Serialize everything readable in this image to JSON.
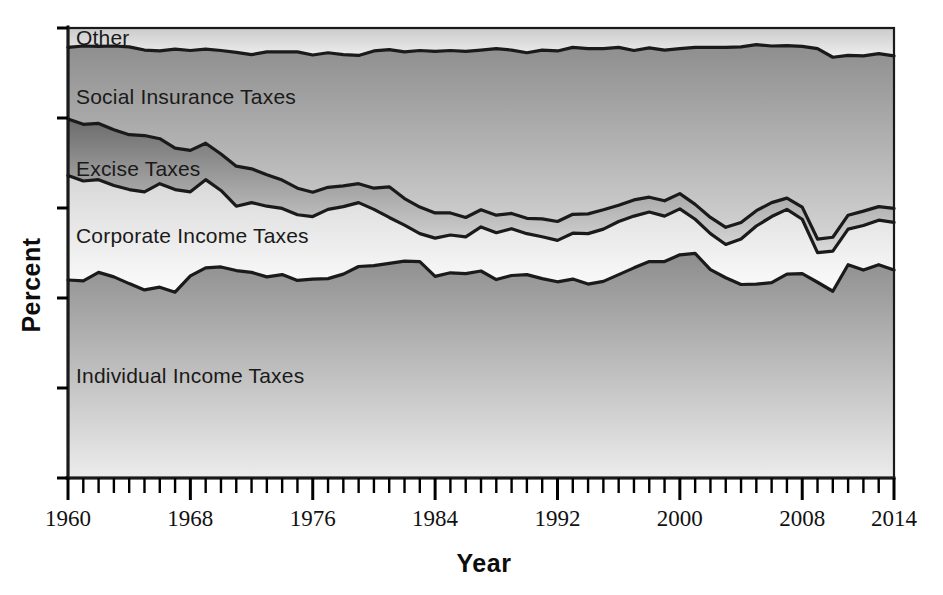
{
  "chart_data": {
    "type": "area",
    "stacked": "percent",
    "title": "",
    "xlabel": "Year",
    "ylabel": "Percent",
    "grid": false,
    "legend_position": "inline-labels",
    "xlim": [
      1960,
      2014
    ],
    "ylim": [
      0,
      100
    ],
    "x_tick_labels": [
      "1960",
      "1968",
      "1976",
      "1984",
      "1992",
      "2000",
      "2008",
      "2014"
    ],
    "x_tick_values": [
      1960,
      1968,
      1976,
      1984,
      1992,
      2000,
      2008,
      2014
    ],
    "x_minor_tick_step": 1,
    "y_tick_labels": [],
    "y_tick_count": 6,
    "x": [
      1960,
      1961,
      1962,
      1963,
      1964,
      1965,
      1966,
      1967,
      1968,
      1969,
      1970,
      1971,
      1972,
      1973,
      1974,
      1975,
      1976,
      1977,
      1978,
      1979,
      1980,
      1981,
      1982,
      1983,
      1984,
      1985,
      1986,
      1987,
      1988,
      1989,
      1990,
      1991,
      1992,
      1993,
      1994,
      1995,
      1996,
      1997,
      1998,
      1999,
      2000,
      2001,
      2002,
      2003,
      2004,
      2005,
      2006,
      2007,
      2008,
      2009,
      2010,
      2011,
      2012,
      2013,
      2014
    ],
    "series": [
      {
        "name": "Individual Income Taxes",
        "fill_top": "#8d8d8d",
        "fill_bottom": "#e8e8e8",
        "values": [
          44.0,
          43.8,
          45.7,
          44.7,
          43.2,
          41.8,
          42.4,
          41.3,
          44.9,
          46.7,
          46.9,
          46.1,
          45.7,
          44.7,
          45.2,
          43.9,
          44.2,
          44.3,
          45.3,
          47.0,
          47.2,
          47.7,
          48.2,
          48.1,
          44.8,
          45.6,
          45.4,
          46.0,
          44.1,
          45.0,
          45.2,
          44.3,
          43.6,
          44.2,
          43.1,
          43.7,
          45.2,
          46.7,
          48.1,
          48.1,
          49.6,
          49.9,
          46.3,
          44.5,
          43.0,
          43.1,
          43.4,
          45.3,
          45.4,
          43.5,
          41.5,
          47.4,
          46.2,
          47.4,
          46.2
        ]
      },
      {
        "name": "Corporate Income Taxes",
        "fill_top": "#d9d9d9",
        "fill_bottom": "#fbfbfb",
        "values": [
          23.2,
          22.2,
          20.6,
          20.3,
          20.9,
          21.8,
          23.0,
          22.8,
          18.7,
          19.6,
          17.0,
          14.3,
          15.5,
          15.7,
          14.7,
          14.6,
          13.9,
          15.4,
          15.0,
          14.2,
          12.5,
          10.2,
          8.0,
          6.2,
          8.5,
          8.4,
          8.2,
          9.8,
          10.4,
          10.4,
          9.1,
          9.3,
          9.2,
          10.2,
          11.2,
          11.6,
          11.8,
          11.5,
          11.0,
          10.1,
          10.2,
          7.6,
          8.0,
          7.4,
          10.1,
          12.9,
          14.7,
          14.4,
          12.1,
          6.6,
          8.9,
          7.9,
          9.9,
          9.9,
          10.6
        ]
      },
      {
        "name": "Excise Taxes",
        "fill_top": "#6f6f6f",
        "fill_bottom": "#d5d5d5",
        "values": [
          12.6,
          12.6,
          12.5,
          12.4,
          12.2,
          12.5,
          10.0,
          9.2,
          9.2,
          8.1,
          8.1,
          8.9,
          7.5,
          7.0,
          6.3,
          5.9,
          5.4,
          4.9,
          4.6,
          4.2,
          4.7,
          6.8,
          5.9,
          5.9,
          5.6,
          4.9,
          4.3,
          3.8,
          3.9,
          3.4,
          3.4,
          4.0,
          4.2,
          4.2,
          4.4,
          4.3,
          3.6,
          3.6,
          3.3,
          3.4,
          3.4,
          3.3,
          3.6,
          3.8,
          3.7,
          3.4,
          3.1,
          2.5,
          2.7,
          3.0,
          3.1,
          3.1,
          3.2,
          3.0,
          3.1
        ]
      },
      {
        "name": "Social Insurance Taxes",
        "fill_top": "#949494",
        "fill_bottom": "#d2d2d2",
        "values": [
          15.9,
          17.4,
          17.1,
          18.6,
          19.5,
          19.0,
          19.5,
          22.0,
          22.2,
          20.9,
          23.0,
          25.3,
          25.4,
          27.3,
          28.5,
          30.3,
          30.5,
          29.9,
          29.2,
          28.5,
          30.5,
          30.5,
          32.6,
          34.8,
          35.9,
          36.1,
          36.9,
          35.5,
          37.0,
          36.3,
          36.8,
          37.5,
          37.9,
          37.1,
          36.7,
          35.8,
          35.1,
          33.2,
          33.2,
          33.5,
          32.2,
          34.9,
          37.8,
          40.0,
          39.0,
          36.9,
          34.8,
          33.9,
          35.7,
          42.3,
          40.0,
          35.5,
          34.5,
          34.0,
          33.9
        ]
      },
      {
        "name": "Other",
        "fill_top": "#cfcfcf",
        "fill_bottom": "#eeeeee",
        "values": [
          4.3,
          4.0,
          4.1,
          4.0,
          4.2,
          4.9,
          5.1,
          4.7,
          5.0,
          4.7,
          5.0,
          5.4,
          5.9,
          5.3,
          5.3,
          5.3,
          6.0,
          5.5,
          5.9,
          6.1,
          5.1,
          4.8,
          5.3,
          5.0,
          5.2,
          5.0,
          5.2,
          4.9,
          4.6,
          4.9,
          5.5,
          4.9,
          5.1,
          4.3,
          4.6,
          4.6,
          4.3,
          5.0,
          4.4,
          4.9,
          4.6,
          4.3,
          4.3,
          4.3,
          4.2,
          3.7,
          4.0,
          3.9,
          4.1,
          4.6,
          6.5,
          6.1,
          6.2,
          5.7,
          6.2
        ]
      }
    ],
    "inline_labels": [
      {
        "text": "Other",
        "series": "Other"
      },
      {
        "text": "Social Insurance Taxes",
        "series": "Social Insurance Taxes"
      },
      {
        "text": "Excise Taxes",
        "series": "Excise Taxes"
      },
      {
        "text": "Corporate Income Taxes",
        "series": "Corporate Income Taxes"
      },
      {
        "text": "Individual Income Taxes",
        "series": "Individual Income Taxes"
      }
    ]
  },
  "axis": {
    "x_title": "Year",
    "y_title": "Percent"
  },
  "labels": {
    "other": "Other",
    "social_insurance": "Social Insurance Taxes",
    "excise": "Excise Taxes",
    "corporate": "Corporate Income Taxes",
    "individual": "Individual Income Taxes"
  },
  "ticks": {
    "x": [
      "1960",
      "1968",
      "1976",
      "1984",
      "1992",
      "2000",
      "2008",
      "2014"
    ]
  },
  "colors": {
    "axis": "#000000",
    "outline": "#1a1a1a",
    "background": "#ffffff"
  }
}
